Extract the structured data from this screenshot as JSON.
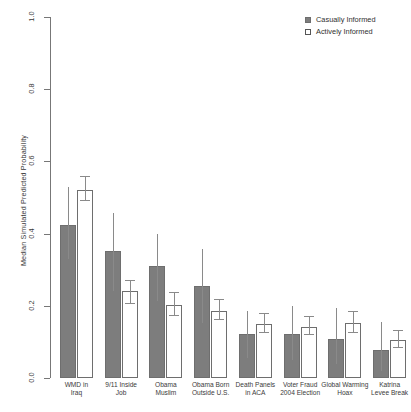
{
  "chart_data": {
    "type": "bar",
    "title": "",
    "subtitle": "",
    "xlabel": "",
    "ylabel": "Median Simulated Predicted Probability",
    "ylim": [
      0.0,
      1.0
    ],
    "yticks": [
      "0.0",
      "0.2",
      "0.4",
      "0.6",
      "0.8",
      "1.0"
    ],
    "ytick_values": [
      0.0,
      0.2,
      0.4,
      0.6,
      0.8,
      1.0
    ],
    "grid": false,
    "legend_position": "top-right",
    "orientation": "vertical",
    "error_bars": "95% interval",
    "categories": [
      "WMD in Iraq",
      "9/11 Inside Job",
      "Obama Muslim",
      "Obama Born Outside U.S.",
      "Death Panels in ACA",
      "Voter Fraud 2004 Election",
      "Global Warming Hoax",
      "Katrina Levee Break"
    ],
    "category_lines": [
      [
        "WMD in",
        "Iraq"
      ],
      [
        "9/11 Inside",
        "Job"
      ],
      [
        "Obama",
        "Muslim"
      ],
      [
        "Obama Born",
        "Outside U.S."
      ],
      [
        "Death Panels",
        "in ACA"
      ],
      [
        "Voter Fraud",
        "2004 Election"
      ],
      [
        "Global Warming",
        "Hoax"
      ],
      [
        "Katrina",
        "Levee Break"
      ]
    ],
    "series": [
      {
        "name": "Casually Informed",
        "color": "#7d7d7d",
        "values": [
          0.425,
          0.353,
          0.31,
          0.256,
          0.122,
          0.122,
          0.108,
          0.078
        ],
        "err_low": [
          0.33,
          0.24,
          0.214,
          0.153,
          0.056,
          0.05,
          0.038,
          0.02
        ],
        "err_high": [
          0.53,
          0.458,
          0.4,
          0.358,
          0.186,
          0.2,
          0.195,
          0.155
        ]
      },
      {
        "name": "Actively Informed",
        "color": "#ffffff",
        "values": [
          0.52,
          0.242,
          0.203,
          0.186,
          0.15,
          0.142,
          0.153,
          0.105
        ],
        "err_low": [
          0.49,
          0.205,
          0.172,
          0.16,
          0.125,
          0.118,
          0.126,
          0.082
        ],
        "err_high": [
          0.558,
          0.27,
          0.236,
          0.216,
          0.178,
          0.168,
          0.183,
          0.13
        ]
      }
    ]
  },
  "legend": {
    "items": [
      {
        "label": "Casually Informed",
        "swatch": "filled-square-icon"
      },
      {
        "label": "Actively Informed",
        "swatch": "open-square-icon"
      }
    ]
  }
}
